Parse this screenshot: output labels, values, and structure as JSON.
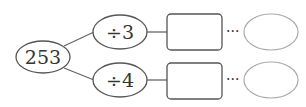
{
  "diagram": {
    "start": {
      "label": "253"
    },
    "branches": [
      {
        "operation": "÷3",
        "result_box": "",
        "ellipsis": "···",
        "final": ""
      },
      {
        "operation": "÷4",
        "result_box": "",
        "ellipsis": "···",
        "final": ""
      }
    ],
    "colors": {
      "stroke": "#555555",
      "light_stroke": "#999999",
      "text": "#333333"
    }
  }
}
